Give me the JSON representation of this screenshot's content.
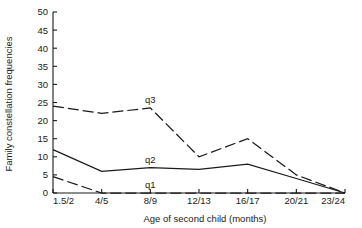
{
  "chart_data": {
    "type": "line",
    "title": "",
    "xlabel": "Age of second child (months)",
    "ylabel": "Family constellation frequencies",
    "categories": [
      "1.5/2",
      "4/5",
      "8/9",
      "12/13",
      "16/17",
      "20/21",
      "23/24"
    ],
    "ylim": [
      0,
      50
    ],
    "yticks": [
      0,
      5,
      10,
      15,
      20,
      25,
      30,
      35,
      40,
      45,
      50
    ],
    "ytick_labels": [
      "0",
      "5",
      "10",
      "15",
      "20",
      "25",
      "30",
      "35",
      "40",
      "45",
      "50"
    ],
    "grid": false,
    "legend": "inline-labels",
    "series": [
      {
        "name": "q3",
        "label": "q3",
        "style": "dashed",
        "color": "#1a1a1a",
        "values": [
          24,
          22,
          23.5,
          10,
          15,
          5,
          0
        ]
      },
      {
        "name": "q2",
        "label": "q2",
        "style": "solid",
        "color": "#1a1a1a",
        "values": [
          12,
          6,
          7,
          6.5,
          8,
          4,
          0
        ]
      },
      {
        "name": "q1",
        "label": "q1",
        "style": "dashed",
        "color": "#1a1a1a",
        "values": [
          4.5,
          0,
          0,
          0,
          0,
          0,
          0
        ]
      }
    ],
    "annotations": [
      {
        "text": "q3",
        "series": "q3",
        "x_index": 2,
        "value": 23.5
      },
      {
        "text": "q2",
        "series": "q2",
        "x_index": 2,
        "value": 7
      },
      {
        "text": "q1",
        "series": "q1",
        "x_index": 2,
        "value": 0
      }
    ]
  }
}
